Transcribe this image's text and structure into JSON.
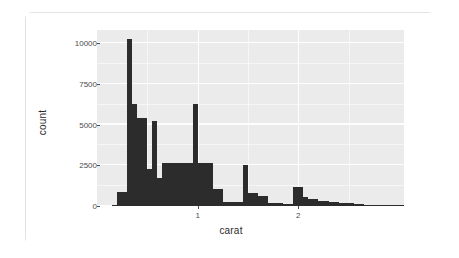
{
  "card": {
    "name": "plot-card"
  },
  "chart_data": {
    "type": "bar",
    "subtype": "histogram",
    "title": "",
    "xlabel": "carat",
    "ylabel": "count",
    "binwidth": 0.05,
    "xlim": [
      0.0,
      3.05
    ],
    "ylim": [
      0,
      10800
    ],
    "grid": true,
    "legend": "none",
    "panel_background": "#ebebeb",
    "bar_color": "#2c2c2c",
    "x_ticks": [
      {
        "value": 1,
        "label": "1"
      },
      {
        "value": 2,
        "label": "2"
      }
    ],
    "x_minor_ticks": [
      0.5,
      1.5,
      2.5
    ],
    "y_ticks": [
      {
        "value": 0,
        "label": "0"
      },
      {
        "value": 2500,
        "label": "2500"
      },
      {
        "value": 5000,
        "label": "5000"
      },
      {
        "value": 7500,
        "label": "7500"
      },
      {
        "value": 10000,
        "label": "10000"
      }
    ],
    "y_minor_ticks": [
      1250,
      3750,
      6250,
      8750
    ],
    "bins": [
      {
        "x0": 0.15,
        "x1": 0.2,
        "count": 30
      },
      {
        "x0": 0.2,
        "x1": 0.25,
        "count": 840
      },
      {
        "x0": 0.25,
        "x1": 0.3,
        "count": 830
      },
      {
        "x0": 0.3,
        "x1": 0.35,
        "count": 10250
      },
      {
        "x0": 0.35,
        "x1": 0.4,
        "count": 6280
      },
      {
        "x0": 0.4,
        "x1": 0.45,
        "count": 5430
      },
      {
        "x0": 0.45,
        "x1": 0.5,
        "count": 5400
      },
      {
        "x0": 0.5,
        "x1": 0.55,
        "count": 2290
      },
      {
        "x0": 0.55,
        "x1": 0.6,
        "count": 5230
      },
      {
        "x0": 0.6,
        "x1": 0.65,
        "count": 1720
      },
      {
        "x0": 0.65,
        "x1": 0.7,
        "count": 2620
      },
      {
        "x0": 0.7,
        "x1": 0.75,
        "count": 2620
      },
      {
        "x0": 0.75,
        "x1": 0.8,
        "count": 2620
      },
      {
        "x0": 0.8,
        "x1": 0.85,
        "count": 2620
      },
      {
        "x0": 0.85,
        "x1": 0.9,
        "count": 2620
      },
      {
        "x0": 0.9,
        "x1": 0.95,
        "count": 2620
      },
      {
        "x0": 0.95,
        "x1": 1.0,
        "count": 6230
      },
      {
        "x0": 1.0,
        "x1": 1.05,
        "count": 2650
      },
      {
        "x0": 1.05,
        "x1": 1.1,
        "count": 2650
      },
      {
        "x0": 1.1,
        "x1": 1.15,
        "count": 2650
      },
      {
        "x0": 1.15,
        "x1": 1.2,
        "count": 1060
      },
      {
        "x0": 1.2,
        "x1": 1.25,
        "count": 1060
      },
      {
        "x0": 1.25,
        "x1": 1.3,
        "count": 260
      },
      {
        "x0": 1.3,
        "x1": 1.35,
        "count": 260
      },
      {
        "x0": 1.35,
        "x1": 1.4,
        "count": 260
      },
      {
        "x0": 1.4,
        "x1": 1.45,
        "count": 260
      },
      {
        "x0": 1.45,
        "x1": 1.5,
        "count": 2530
      },
      {
        "x0": 1.5,
        "x1": 1.55,
        "count": 800
      },
      {
        "x0": 1.55,
        "x1": 1.6,
        "count": 800
      },
      {
        "x0": 1.6,
        "x1": 1.65,
        "count": 600
      },
      {
        "x0": 1.65,
        "x1": 1.7,
        "count": 600
      },
      {
        "x0": 1.7,
        "x1": 1.75,
        "count": 210
      },
      {
        "x0": 1.75,
        "x1": 1.8,
        "count": 210
      },
      {
        "x0": 1.8,
        "x1": 1.85,
        "count": 210
      },
      {
        "x0": 1.85,
        "x1": 1.9,
        "count": 150
      },
      {
        "x0": 1.9,
        "x1": 1.95,
        "count": 150
      },
      {
        "x0": 1.95,
        "x1": 2.0,
        "count": 1180
      },
      {
        "x0": 2.0,
        "x1": 2.05,
        "count": 1180
      },
      {
        "x0": 2.05,
        "x1": 2.1,
        "count": 560
      },
      {
        "x0": 2.1,
        "x1": 2.15,
        "count": 430
      },
      {
        "x0": 2.15,
        "x1": 2.2,
        "count": 430
      },
      {
        "x0": 2.2,
        "x1": 2.25,
        "count": 300
      },
      {
        "x0": 2.25,
        "x1": 2.3,
        "count": 300
      },
      {
        "x0": 2.3,
        "x1": 2.35,
        "count": 250
      },
      {
        "x0": 2.35,
        "x1": 2.4,
        "count": 250
      },
      {
        "x0": 2.4,
        "x1": 2.45,
        "count": 200
      },
      {
        "x0": 2.45,
        "x1": 2.5,
        "count": 200
      },
      {
        "x0": 2.5,
        "x1": 2.55,
        "count": 160
      },
      {
        "x0": 2.55,
        "x1": 2.6,
        "count": 130
      },
      {
        "x0": 2.6,
        "x1": 2.65,
        "count": 110
      },
      {
        "x0": 2.65,
        "x1": 2.7,
        "count": 90
      },
      {
        "x0": 2.7,
        "x1": 2.75,
        "count": 70
      },
      {
        "x0": 2.75,
        "x1": 2.8,
        "count": 55
      },
      {
        "x0": 2.8,
        "x1": 2.85,
        "count": 40
      },
      {
        "x0": 2.85,
        "x1": 2.9,
        "count": 30
      },
      {
        "x0": 2.9,
        "x1": 2.95,
        "count": 20
      },
      {
        "x0": 2.95,
        "x1": 3.0,
        "count": 12
      },
      {
        "x0": 3.0,
        "x1": 3.05,
        "count": 8
      }
    ]
  }
}
